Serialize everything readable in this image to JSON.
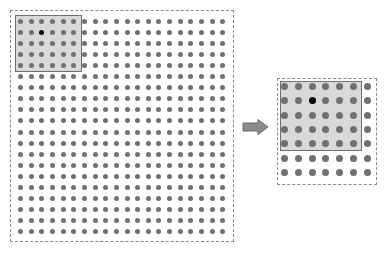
{
  "diagram": {
    "colors": {
      "dot": "#707070",
      "center_dot": "#000000",
      "window_fill": "#d9d9d9",
      "window_border": "#6e6e6e",
      "dashed_border": "#8a8a8a",
      "arrow": "#808080"
    },
    "left_grid": {
      "rows": 20,
      "cols": 20,
      "window": {
        "rows": 5,
        "cols": 6,
        "center_row": 1,
        "center_col": 2
      }
    },
    "arrow": {
      "direction": "right"
    },
    "right_zoom": {
      "rows": 7,
      "cols": 7,
      "window": {
        "rows": 5,
        "cols": 6,
        "center_row": 1,
        "center_col": 2
      }
    }
  }
}
